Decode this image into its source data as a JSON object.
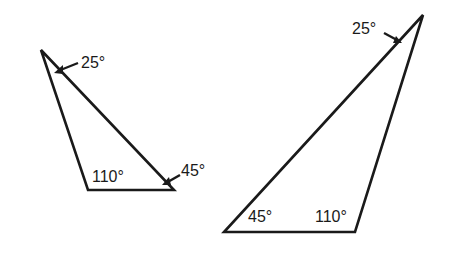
{
  "diagram": {
    "type": "similar-triangles",
    "triangles": [
      {
        "id": "small",
        "vertices": {
          "apex": [
            41,
            50
          ],
          "bottom_left": [
            88,
            190
          ],
          "bottom_right": [
            174,
            190
          ]
        },
        "angles": {
          "apex": "25°",
          "bottom_left": "110°",
          "bottom_right": "45°"
        }
      },
      {
        "id": "large",
        "vertices": {
          "apex": [
            423,
            15
          ],
          "bottom_left": [
            224,
            232
          ],
          "bottom_right": [
            355,
            232
          ]
        },
        "angles": {
          "apex": "25°",
          "bottom_left": "45°",
          "bottom_right": "110°"
        }
      }
    ],
    "stroke_color": "#1a1a1a"
  }
}
